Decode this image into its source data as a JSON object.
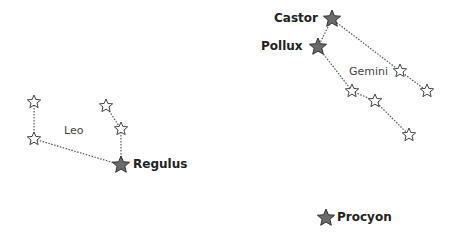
{
  "colors": {
    "bright_star_fill": "#6b6b6b",
    "bright_star_stroke": "#333333",
    "dim_star_fill": "#ffffff",
    "dim_star_stroke": "#444444",
    "line": "#555555"
  },
  "constellations": [
    {
      "name": "Leo",
      "label_pos": [
        64,
        125
      ],
      "stars": [
        {
          "id": "leo1",
          "x": 34,
          "y": 102,
          "bright": false
        },
        {
          "id": "leo2",
          "x": 34,
          "y": 139,
          "bright": false
        },
        {
          "id": "leo3",
          "x": 106,
          "y": 106,
          "bright": false
        },
        {
          "id": "leo4",
          "x": 121,
          "y": 129,
          "bright": false
        },
        {
          "id": "regulus",
          "x": 121,
          "y": 165,
          "bright": true,
          "name": "Regulus"
        }
      ],
      "lines": [
        [
          "leo1",
          "leo2"
        ],
        [
          "leo2",
          "regulus"
        ],
        [
          "leo3",
          "leo4"
        ],
        [
          "leo4",
          "regulus"
        ]
      ]
    },
    {
      "name": "Gemini",
      "label_pos": [
        349,
        66
      ],
      "stars": [
        {
          "id": "castor",
          "x": 332,
          "y": 19,
          "bright": true,
          "name": "Castor"
        },
        {
          "id": "pollux",
          "x": 318,
          "y": 47,
          "bright": true,
          "name": "Pollux"
        },
        {
          "id": "gem1",
          "x": 400,
          "y": 71,
          "bright": false
        },
        {
          "id": "gem2",
          "x": 427,
          "y": 91,
          "bright": false
        },
        {
          "id": "gem3",
          "x": 352,
          "y": 91,
          "bright": false
        },
        {
          "id": "gem4",
          "x": 375,
          "y": 101,
          "bright": false
        },
        {
          "id": "gem5",
          "x": 409,
          "y": 135,
          "bright": false
        }
      ],
      "lines": [
        [
          "castor",
          "pollux"
        ],
        [
          "castor",
          "gem1"
        ],
        [
          "gem1",
          "gem2"
        ],
        [
          "pollux",
          "gem3"
        ],
        [
          "gem3",
          "gem4"
        ],
        [
          "gem4",
          "gem5"
        ]
      ]
    }
  ],
  "standalone": [
    {
      "id": "procyon",
      "x": 326,
      "y": 218,
      "bright": true,
      "name": "Procyon"
    }
  ],
  "labels": {
    "leo": "Leo",
    "gemini": "Gemini",
    "regulus": "Regulus",
    "castor": "Castor",
    "pollux": "Pollux",
    "procyon": "Procyon"
  }
}
